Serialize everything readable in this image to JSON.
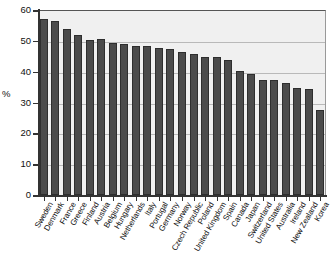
{
  "chart_data": {
    "type": "bar",
    "title": "",
    "subtitle": "",
    "xlabel": "",
    "ylabel": "%",
    "ylim": [
      0,
      60
    ],
    "yticks": [
      0,
      10,
      20,
      30,
      40,
      50,
      60
    ],
    "ytick_labels": [
      "0",
      "10",
      "20",
      "30",
      "40",
      "50",
      "60"
    ],
    "grid": true,
    "legend": false,
    "legend_position": "none",
    "bar_color": "#4b4b4b",
    "plot_background": "#f0f0f0",
    "categories": [
      "Sweden",
      "Denmark",
      "France",
      "Greece",
      "Finland",
      "Austria",
      "Belgium",
      "Hungary",
      "Netherlands",
      "Italy",
      "Portugal",
      "Germany",
      "Norway",
      "Czech Republic",
      "Poland",
      "United Kingdom",
      "Spain",
      "Canada",
      "Japan",
      "Switzerland",
      "United States",
      "Australia",
      "Ireland",
      "New Zealand",
      "Korea"
    ],
    "values": [
      57.2,
      56.3,
      54.0,
      51.8,
      50.4,
      50.6,
      49.2,
      49.1,
      48.4,
      48.3,
      47.8,
      47.3,
      46.5,
      45.6,
      44.8,
      44.6,
      43.8,
      40.2,
      39.1,
      37.3,
      37.3,
      36.4,
      34.6,
      34.4,
      27.5
    ]
  }
}
